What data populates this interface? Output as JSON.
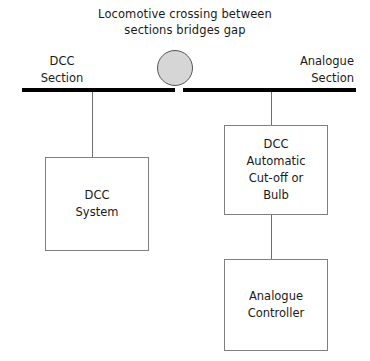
{
  "diagram": {
    "title": {
      "line1": "Locomotive crossing between",
      "line2": "sections bridges gap"
    },
    "track": {
      "left_section": {
        "line1": "DCC",
        "line2": "Section"
      },
      "right_section": {
        "line1": "Analogue",
        "line2": "Section"
      }
    },
    "locomotive": {
      "label": "locomotive",
      "fill_color": "#d6d6d6",
      "border_color": "#555555"
    },
    "boxes": {
      "dcc_system": {
        "line1": "DCC",
        "line2": "System"
      },
      "dcc_cutoff": {
        "line1": "DCC",
        "line2": "Automatic",
        "line3": "Cut-off or",
        "line4": "Bulb"
      },
      "analogue_controller": {
        "line1": "Analogue",
        "line2": "Controller"
      }
    },
    "colors": {
      "rail": "#000000",
      "box_border": "#808080",
      "connector": "#6f6f6f",
      "background": "#ffffff",
      "text": "#1a1a1a"
    }
  }
}
